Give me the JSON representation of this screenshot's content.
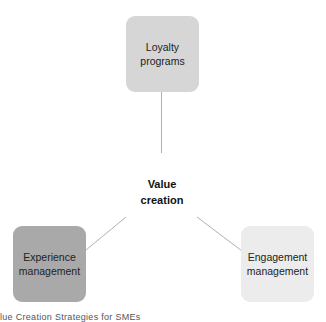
{
  "diagram": {
    "type": "hub-and-spoke",
    "center": {
      "label_line1": "Value",
      "label_line2": "creation"
    },
    "nodes": [
      {
        "id": "top",
        "label_line1": "Loyalty",
        "label_line2": "programs",
        "fill": "#d6d6d6"
      },
      {
        "id": "left",
        "label_line1": "Experience",
        "label_line2": "management",
        "fill": "#a9a9a9"
      },
      {
        "id": "right",
        "label_line1": "Engagement",
        "label_line2": "management",
        "fill": "#ececec"
      }
    ],
    "connector_color": "#b0b0b0"
  },
  "caption": {
    "text": "lue Creation Strategies for SMEs"
  }
}
